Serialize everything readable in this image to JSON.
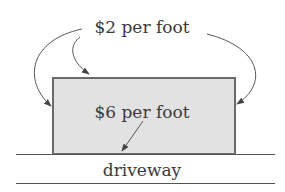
{
  "diagram": {
    "top_label": "$2 per foot",
    "inner_label": "$6 per foot",
    "bottom_label": "driveway",
    "colors": {
      "rect_fill": "#e2e2e2",
      "rect_stroke": "#6a6a6a",
      "line": "#555555",
      "text": "#3a3a3a"
    }
  }
}
